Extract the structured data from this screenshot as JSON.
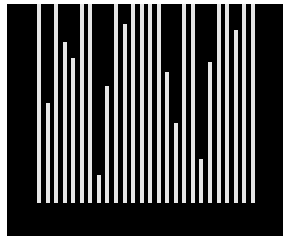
{
  "chart_data": {
    "type": "bar",
    "title": "",
    "xlabel": "",
    "ylabel": "",
    "grid": false,
    "legend": null,
    "background_color": "#000000",
    "bar_color": "#e6e6e6",
    "categories": [
      "1",
      "2",
      "3",
      "4",
      "5",
      "6",
      "7",
      "8",
      "9",
      "10",
      "11",
      "12",
      "13",
      "14",
      "15",
      "16",
      "17",
      "18",
      "19",
      "20",
      "21",
      "22",
      "23",
      "24",
      "25",
      "26"
    ],
    "values": [
      1.0,
      0.5,
      1.0,
      0.81,
      0.73,
      1.0,
      1.0,
      0.14,
      0.59,
      1.0,
      0.9,
      1.0,
      1.0,
      1.0,
      1.0,
      0.66,
      0.4,
      1.0,
      1.0,
      0.22,
      0.71,
      1.0,
      1.0,
      0.87,
      1.0,
      1.0
    ],
    "ylim": [
      0,
      1
    ]
  },
  "layout": {
    "first_bar_x": 30,
    "bar_spacing": 8.55,
    "bar_width": 4,
    "baseline_y": 199,
    "full_height": 199
  }
}
